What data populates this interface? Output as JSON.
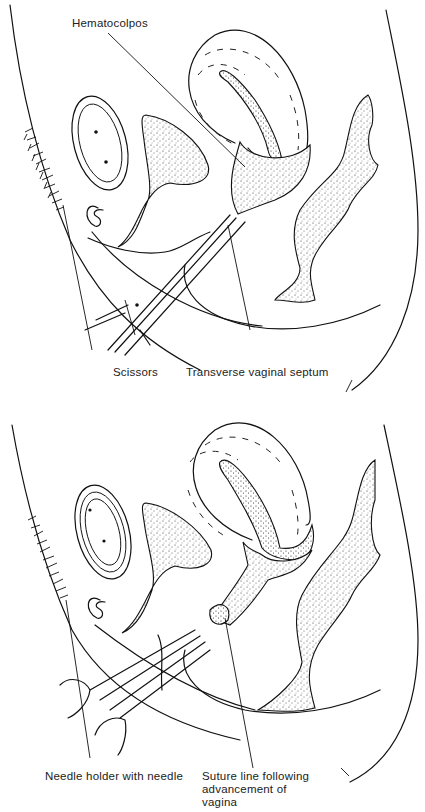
{
  "figure": {
    "panels": [
      {
        "id": "top",
        "description": "Excision of transverse vaginal septum with scissors",
        "labels": {
          "hematocolpos": "Hematocolpos",
          "scissors": "Scissors",
          "septum": "Transverse vaginal septum"
        }
      },
      {
        "id": "bottom",
        "description": "Suture of vaginal mucosa after advancement",
        "labels": {
          "needle_holder": "Needle holder with needle",
          "suture_line": "Suture line following advancement of vagina"
        }
      }
    ],
    "colors": {
      "ink": "#111111",
      "background": "#ffffff"
    }
  }
}
